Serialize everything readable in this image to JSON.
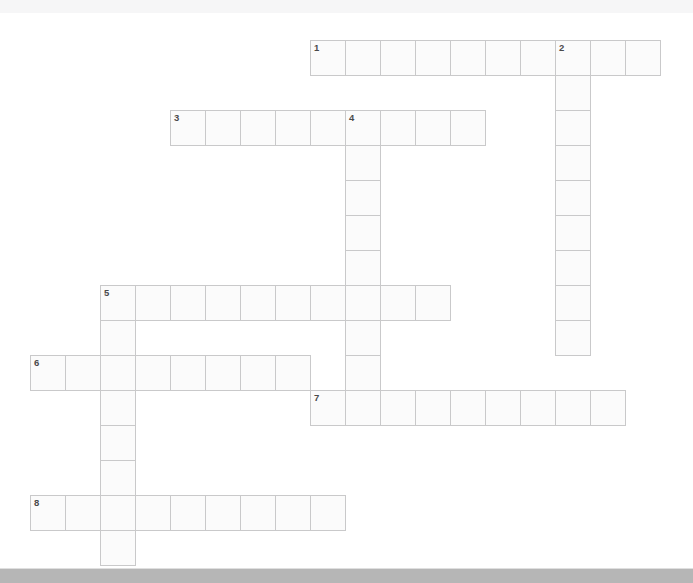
{
  "page": {
    "type": "crossword-puzzle-grid",
    "background_color": "#ffffff",
    "top_bar_color": "#f6f6f7",
    "bottom_bar_color": "#b6b6b6",
    "cell_fill_color": "#fbfbfb",
    "cell_border_color": "#c9c9ca",
    "number_color": "#4a4a4a"
  },
  "grid": {
    "cell_size": 35,
    "origin_x": 30,
    "origin_y": 27,
    "columns": 19,
    "rows": 16
  },
  "entries": [
    {
      "number": "1",
      "direction": "across",
      "row": 0,
      "col": 8,
      "length": 10
    },
    {
      "number": "2",
      "direction": "down",
      "row": 0,
      "col": 15,
      "length": 9
    },
    {
      "number": "3",
      "direction": "across",
      "row": 2,
      "col": 4,
      "length": 9
    },
    {
      "number": "4",
      "direction": "down",
      "row": 2,
      "col": 9,
      "length": 8
    },
    {
      "number": "5",
      "direction": "across",
      "row": 7,
      "col": 2,
      "length": 10
    },
    {
      "number": "5",
      "direction": "down",
      "row": 7,
      "col": 2,
      "length": 8
    },
    {
      "number": "6",
      "direction": "across",
      "row": 9,
      "col": 0,
      "length": 8
    },
    {
      "number": "7",
      "direction": "across",
      "row": 10,
      "col": 8,
      "length": 9
    },
    {
      "number": "8",
      "direction": "across",
      "row": 13,
      "col": 0,
      "length": 9
    }
  ],
  "numbered_cells": [
    {
      "label": "1",
      "row": 0,
      "col": 8
    },
    {
      "label": "2",
      "row": 0,
      "col": 15
    },
    {
      "label": "3",
      "row": 2,
      "col": 4
    },
    {
      "label": "4",
      "row": 2,
      "col": 9
    },
    {
      "label": "5",
      "row": 7,
      "col": 2
    },
    {
      "label": "6",
      "row": 9,
      "col": 0
    },
    {
      "label": "7",
      "row": 10,
      "col": 8
    },
    {
      "label": "8",
      "row": 13,
      "col": 0
    }
  ],
  "letters": []
}
